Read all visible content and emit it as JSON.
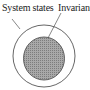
{
  "diagram": {
    "type": "set-inclusion",
    "labels": {
      "outer": "System states",
      "inner": "Invariant"
    },
    "outer_set": {
      "name": "System states",
      "shape": "circle",
      "fill": "#ffffff",
      "stroke": "#555555"
    },
    "inner_set": {
      "name": "Invariant",
      "shape": "ellipse",
      "fill": "#9a9a9a",
      "stroke": "#555555",
      "pattern": "halftone-gray"
    }
  }
}
